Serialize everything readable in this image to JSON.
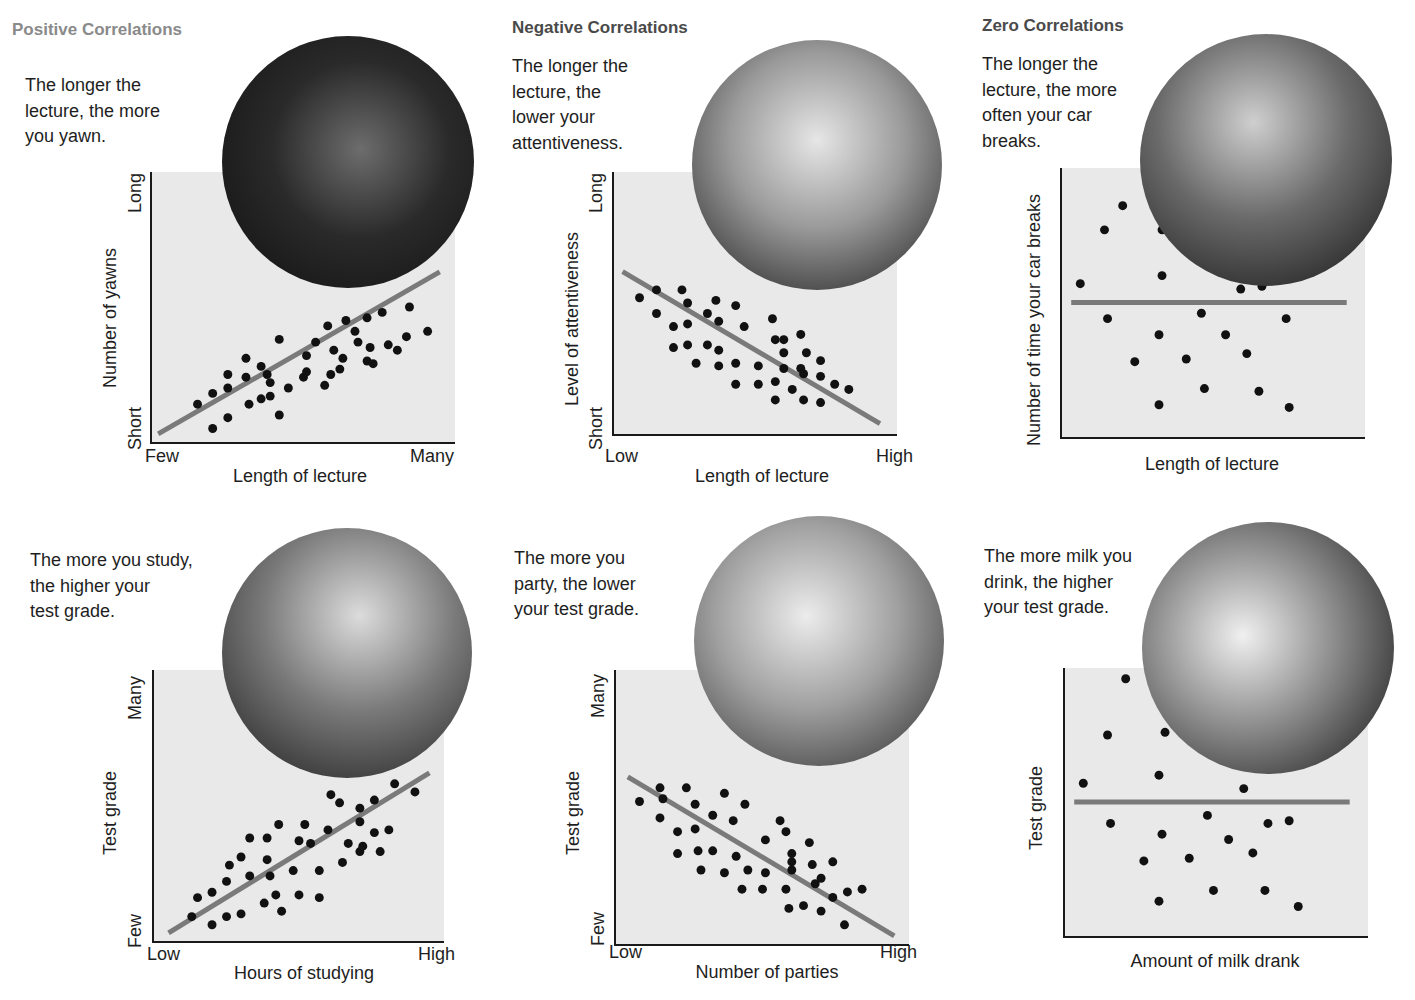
{
  "sections": {
    "positive": {
      "title": "Positive Correlations",
      "color": "#8a8a8a"
    },
    "negative": {
      "title": "Negative Correlations",
      "color": "#4a4a4a"
    },
    "zero": {
      "title": "Zero Correlations",
      "color": "#4a4a4a"
    }
  },
  "colors": {
    "plot_bg": "#e9e9e9",
    "axis": "#1a1a1a",
    "dot": "#111111",
    "trend": "#7a7a7a"
  },
  "panels": [
    {
      "id": "p1",
      "caption": [
        "The longer the",
        "lecture, the more",
        "you yawn."
      ],
      "ylabel": "Number of yawns",
      "xlabel": "Length of lecture",
      "ytick_top": "Long",
      "ytick_bottom": "Short",
      "xtick_left": "Few",
      "xtick_right": "Many",
      "photo": "woman-yawning-photo"
    },
    {
      "id": "p2",
      "caption": [
        "The longer the",
        "lecture, the",
        "lower your",
        "attentiveness."
      ],
      "ylabel": "Level of attentiveness",
      "xlabel": "Length of lecture",
      "ytick_top": "Long",
      "ytick_bottom": "Short",
      "xtick_left": "Low",
      "xtick_right": "High",
      "photo": "bored-student-photo"
    },
    {
      "id": "p3",
      "caption": [
        "The longer the",
        "lecture, the more",
        "often your car",
        "breaks."
      ],
      "ylabel": "Number of time your car breaks",
      "xlabel": "Length of lecture",
      "photo": "mechanics-photo"
    },
    {
      "id": "p4",
      "caption": [
        "The more you study,",
        "the higher your",
        "test grade."
      ],
      "ylabel": "Test grade",
      "xlabel": "Hours of studying",
      "ytick_top": "Many",
      "ytick_bottom": "Few",
      "xtick_left": "Low",
      "xtick_right": "High",
      "photo": "studying-student-photo"
    },
    {
      "id": "p5",
      "caption": [
        "The more you",
        "party, the lower",
        "your test grade."
      ],
      "ylabel": "Test grade",
      "xlabel": "Number of parties",
      "ytick_top": "Many",
      "ytick_bottom": "Few",
      "xtick_left": "Low",
      "xtick_right": "High",
      "photo": "party-photo"
    },
    {
      "id": "p6",
      "caption": [
        "The more milk you",
        "drink, the higher",
        "your test grade."
      ],
      "ylabel": "Test grade",
      "xlabel": "Amount of milk drank",
      "photo": "woman-drinking-milk-photo"
    }
  ],
  "chart_data": [
    {
      "type": "scatter",
      "title": "Positive Correlations",
      "subtitle": "The longer the lecture, the more you yawn.",
      "xlabel": "Length of lecture",
      "ylabel": "Number of yawns",
      "x_ticks": [
        "Few",
        "Many"
      ],
      "y_ticks": [
        "Short",
        "Long"
      ],
      "xlim": [
        0,
        100
      ],
      "ylim": [
        0,
        100
      ],
      "grid": false,
      "trend": {
        "x": [
          2,
          95
        ],
        "y": [
          3,
          63
        ]
      },
      "points": [
        [
          15,
          14
        ],
        [
          20,
          5
        ],
        [
          20,
          18
        ],
        [
          25,
          25
        ],
        [
          25,
          20
        ],
        [
          25,
          9
        ],
        [
          31,
          24
        ],
        [
          31,
          31
        ],
        [
          32,
          14
        ],
        [
          36,
          16
        ],
        [
          36,
          28
        ],
        [
          38,
          25
        ],
        [
          39,
          17
        ],
        [
          39,
          22
        ],
        [
          42,
          38
        ],
        [
          42,
          10
        ],
        [
          45,
          20
        ],
        [
          50,
          24
        ],
        [
          51,
          26
        ],
        [
          51,
          32
        ],
        [
          54,
          37
        ],
        [
          57,
          21
        ],
        [
          58,
          43
        ],
        [
          59,
          25
        ],
        [
          60,
          34
        ],
        [
          62,
          27
        ],
        [
          63,
          31
        ],
        [
          64,
          45
        ],
        [
          67,
          41
        ],
        [
          68,
          37
        ],
        [
          71,
          30
        ],
        [
          71,
          46
        ],
        [
          72,
          35
        ],
        [
          73,
          29
        ],
        [
          76,
          48
        ],
        [
          78,
          36
        ],
        [
          81,
          34
        ],
        [
          84,
          39
        ],
        [
          85,
          50
        ],
        [
          91,
          41
        ]
      ]
    },
    {
      "type": "scatter",
      "title": "Negative Correlations",
      "subtitle": "The longer the lecture, the lower your attentiveness.",
      "xlabel": "Length of lecture",
      "ylabel": "Level of attentiveness",
      "x_ticks": [
        "Low",
        "High"
      ],
      "y_ticks": [
        "Short",
        "Long"
      ],
      "xlim": [
        0,
        100
      ],
      "ylim": [
        0,
        100
      ],
      "grid": false,
      "trend": {
        "x": [
          3,
          94
        ],
        "y": [
          62,
          4
        ]
      },
      "points": [
        [
          9,
          52
        ],
        [
          15,
          55
        ],
        [
          15,
          46
        ],
        [
          21,
          41
        ],
        [
          21,
          33
        ],
        [
          24,
          55
        ],
        [
          26,
          50
        ],
        [
          26,
          42
        ],
        [
          26,
          34
        ],
        [
          29,
          27
        ],
        [
          33,
          46
        ],
        [
          33,
          34
        ],
        [
          36,
          51
        ],
        [
          37,
          43
        ],
        [
          37,
          32
        ],
        [
          37,
          26
        ],
        [
          43,
          49
        ],
        [
          46,
          41
        ],
        [
          43,
          27
        ],
        [
          43,
          19
        ],
        [
          51,
          19
        ],
        [
          51,
          26
        ],
        [
          56,
          44
        ],
        [
          57,
          36
        ],
        [
          57,
          20
        ],
        [
          57,
          13
        ],
        [
          60,
          36
        ],
        [
          60,
          31
        ],
        [
          60,
          25
        ],
        [
          63,
          17
        ],
        [
          66,
          38
        ],
        [
          66,
          25
        ],
        [
          67,
          23
        ],
        [
          67,
          13
        ],
        [
          68,
          31
        ],
        [
          73,
          28
        ],
        [
          73,
          22
        ],
        [
          73,
          12
        ],
        [
          78,
          19
        ],
        [
          83,
          17
        ]
      ]
    },
    {
      "type": "scatter",
      "title": "Zero Correlations",
      "subtitle": "The longer the lecture, the more often your car breaks.",
      "xlabel": "Length of lecture",
      "ylabel": "Number of time your car breaks",
      "xlim": [
        0,
        100
      ],
      "ylim": [
        0,
        100
      ],
      "grid": false,
      "trend": {
        "x": [
          3,
          94
        ],
        "y": [
          50,
          50
        ]
      },
      "points": [
        [
          6,
          57
        ],
        [
          14,
          77
        ],
        [
          15,
          44
        ],
        [
          20,
          86
        ],
        [
          24,
          28
        ],
        [
          33,
          60
        ],
        [
          33,
          77
        ],
        [
          32,
          38
        ],
        [
          32,
          12
        ],
        [
          41,
          29
        ],
        [
          46,
          46
        ],
        [
          47,
          18
        ],
        [
          54,
          38
        ],
        [
          59,
          55
        ],
        [
          61,
          31
        ],
        [
          65,
          17
        ],
        [
          66,
          56
        ],
        [
          74,
          44
        ],
        [
          75,
          11
        ]
      ]
    },
    {
      "type": "scatter",
      "title": "Positive Correlations",
      "subtitle": "The more you study, the higher your test grade.",
      "xlabel": "Hours of studying",
      "ylabel": "Test grade",
      "x_ticks": [
        "Low",
        "High"
      ],
      "y_ticks": [
        "Few",
        "Many"
      ],
      "xlim": [
        0,
        100
      ],
      "ylim": [
        0,
        100
      ],
      "grid": false,
      "trend": {
        "x": [
          5,
          95
        ],
        "y": [
          3,
          62
        ]
      },
      "points": [
        [
          13,
          9
        ],
        [
          15,
          16
        ],
        [
          20,
          6
        ],
        [
          20,
          18
        ],
        [
          25,
          22
        ],
        [
          25,
          9
        ],
        [
          26,
          28
        ],
        [
          30,
          31
        ],
        [
          30,
          10
        ],
        [
          33,
          24
        ],
        [
          33,
          38
        ],
        [
          38,
          14
        ],
        [
          39,
          38
        ],
        [
          39,
          30
        ],
        [
          40,
          24
        ],
        [
          42,
          17
        ],
        [
          43,
          43
        ],
        [
          44,
          11
        ],
        [
          48,
          26
        ],
        [
          50,
          37
        ],
        [
          50,
          17
        ],
        [
          52,
          43
        ],
        [
          57,
          16
        ],
        [
          54,
          36
        ],
        [
          57,
          26
        ],
        [
          60,
          41
        ],
        [
          61,
          54
        ],
        [
          64,
          51
        ],
        [
          65,
          29
        ],
        [
          67,
          36
        ],
        [
          71,
          33
        ],
        [
          71,
          49
        ],
        [
          71,
          44
        ],
        [
          72,
          35
        ],
        [
          76,
          40
        ],
        [
          76,
          52
        ],
        [
          78,
          33
        ],
        [
          81,
          41
        ],
        [
          83,
          58
        ],
        [
          90,
          55
        ]
      ]
    },
    {
      "type": "scatter",
      "title": "Negative Correlations",
      "subtitle": "The more you party, the lower your test grade.",
      "xlabel": "Number of parties",
      "ylabel": "Test grade",
      "x_ticks": [
        "Low",
        "High"
      ],
      "y_ticks": [
        "Few",
        "Many"
      ],
      "xlim": [
        0,
        100
      ],
      "ylim": [
        0,
        100
      ],
      "grid": false,
      "trend": {
        "x": [
          4,
          95
        ],
        "y": [
          61,
          3
        ]
      },
      "points": [
        [
          8,
          52
        ],
        [
          15,
          57
        ],
        [
          16,
          53
        ],
        [
          15,
          46
        ],
        [
          21,
          41
        ],
        [
          21,
          33
        ],
        [
          24,
          57
        ],
        [
          27,
          51
        ],
        [
          27,
          42
        ],
        [
          28,
          34
        ],
        [
          29,
          27
        ],
        [
          33,
          47
        ],
        [
          33,
          34
        ],
        [
          37,
          26
        ],
        [
          37,
          55
        ],
        [
          40,
          45
        ],
        [
          41,
          32
        ],
        [
          43,
          20
        ],
        [
          44,
          51
        ],
        [
          45,
          27
        ],
        [
          50,
          20
        ],
        [
          51,
          26
        ],
        [
          51,
          38
        ],
        [
          56,
          45
        ],
        [
          58,
          41
        ],
        [
          58,
          20
        ],
        [
          59,
          13
        ],
        [
          60,
          30
        ],
        [
          60,
          33
        ],
        [
          60,
          27
        ],
        [
          64,
          14
        ],
        [
          66,
          37
        ],
        [
          67,
          29
        ],
        [
          68,
          22
        ],
        [
          70,
          24
        ],
        [
          70,
          12
        ],
        [
          74,
          30
        ],
        [
          74,
          17
        ],
        [
          79,
          19
        ],
        [
          78,
          7
        ],
        [
          84,
          20
        ]
      ]
    },
    {
      "type": "scatter",
      "title": "Zero Correlations",
      "subtitle": "The more milk you drink, the higher your test grade.",
      "xlabel": "Amount of milk drank",
      "ylabel": "Test grade",
      "xlim": [
        0,
        100
      ],
      "ylim": [
        0,
        100
      ],
      "grid": false,
      "trend": {
        "x": [
          3,
          94
        ],
        "y": [
          50,
          50
        ]
      },
      "points": [
        [
          6,
          57
        ],
        [
          14,
          75
        ],
        [
          15,
          42
        ],
        [
          20,
          96
        ],
        [
          26,
          28
        ],
        [
          31,
          60
        ],
        [
          33,
          76
        ],
        [
          32,
          38
        ],
        [
          31,
          13
        ],
        [
          41,
          29
        ],
        [
          47,
          45
        ],
        [
          49,
          17
        ],
        [
          54,
          36
        ],
        [
          59,
          55
        ],
        [
          62,
          31
        ],
        [
          66,
          17
        ],
        [
          67,
          42
        ],
        [
          74,
          43
        ],
        [
          77,
          11
        ]
      ]
    }
  ]
}
